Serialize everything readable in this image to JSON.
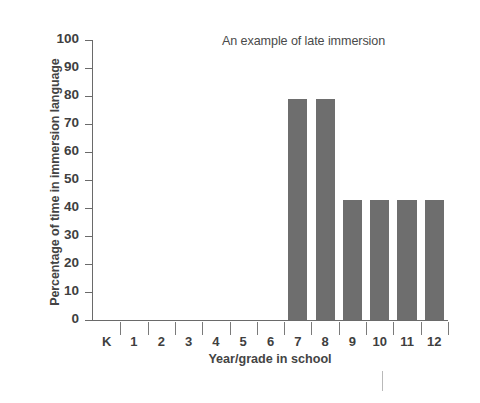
{
  "chart_data": {
    "type": "bar",
    "title": "An example of late immersion",
    "xlabel": "Year/grade in school",
    "ylabel": "Percentage of time in immersion language",
    "categories": [
      "K",
      "1",
      "2",
      "3",
      "4",
      "5",
      "6",
      "7",
      "8",
      "9",
      "10",
      "11",
      "12"
    ],
    "values": [
      0,
      0,
      0,
      0,
      0,
      0,
      0,
      79,
      79,
      43,
      43,
      43,
      43
    ],
    "ylim": [
      0,
      100
    ],
    "ytick_labels": [
      "100",
      "90",
      "80",
      "70",
      "60",
      "50",
      "40",
      "30",
      "20",
      "10",
      "0"
    ],
    "ytick_values": [
      100,
      90,
      80,
      70,
      60,
      50,
      40,
      30,
      20,
      10,
      0
    ],
    "grid": false,
    "legend": false,
    "bar_color": "#6e6e6e",
    "axis_color": "#6a6a6a",
    "text_color": "#3f3f3f",
    "background": "#ffffff"
  }
}
